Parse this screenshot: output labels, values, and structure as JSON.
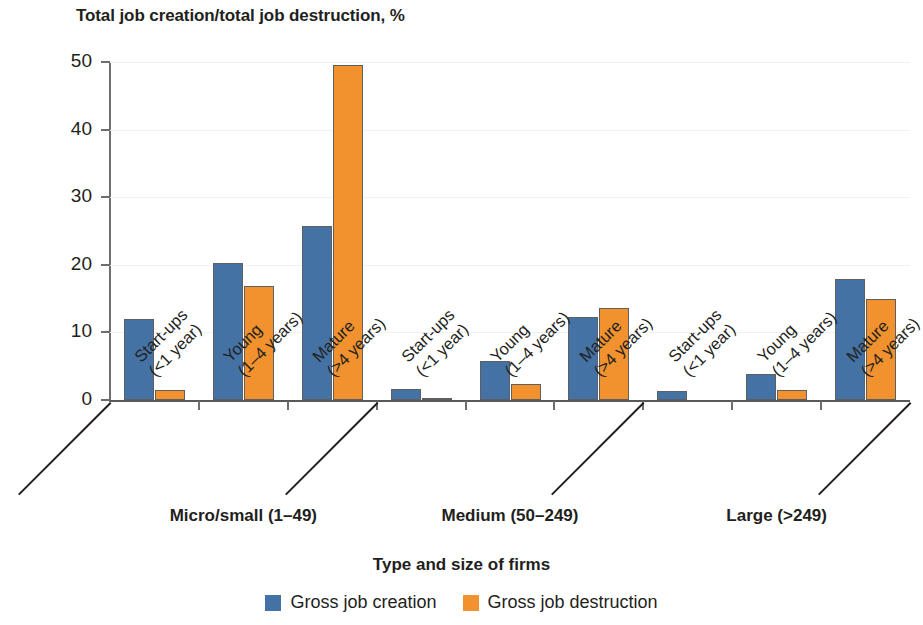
{
  "chart_data": {
    "type": "bar",
    "title": "Total job creation/total job destruction, %",
    "xlabel": "Type and size of firms",
    "ylabel": "",
    "ylim": [
      0,
      50
    ],
    "yticks": [
      0,
      10,
      20,
      30,
      40,
      50
    ],
    "grid": true,
    "legend_position": "bottom",
    "categories": [
      "Start-ups (<1 year)",
      "Young (1–4 years)",
      "Mature (>4 years)",
      "Start-ups (<1 year)",
      "Young (1–4 years)",
      "Mature (>4 years)",
      "Start-ups (<1 year)",
      "Young (1–4 years)",
      "Mature (>4 years)"
    ],
    "category_lines": [
      [
        "Start-ups",
        "(<1 year)"
      ],
      [
        "Young",
        "(1–4 years)"
      ],
      [
        "Mature",
        "(>4 years)"
      ],
      [
        "Start-ups",
        "(<1 year)"
      ],
      [
        "Young",
        "(1–4 years)"
      ],
      [
        "Mature",
        "(>4 years)"
      ],
      [
        "Start-ups",
        "(<1 year)"
      ],
      [
        "Young",
        "(1–4 years)"
      ],
      [
        "Mature",
        "(>4 years)"
      ]
    ],
    "groups": [
      {
        "label": "Micro/small (1–49)",
        "categories": [
          0,
          1,
          2
        ]
      },
      {
        "label": "Medium (50–249)",
        "categories": [
          3,
          4,
          5
        ]
      },
      {
        "label": "Large (>249)",
        "categories": [
          6,
          7,
          8
        ]
      }
    ],
    "series": [
      {
        "name": "Gross job creation",
        "color": "#4472a4",
        "values": [
          12.0,
          20.3,
          25.8,
          1.6,
          5.7,
          12.3,
          1.3,
          3.9,
          17.9
        ]
      },
      {
        "name": "Gross job destruction",
        "color": "#f2922f",
        "values": [
          1.5,
          16.8,
          49.6,
          0.3,
          2.4,
          13.6,
          0.0,
          1.5,
          14.9
        ]
      }
    ]
  },
  "legend": [
    {
      "label": "Gross job creation",
      "swatch": "creation"
    },
    {
      "label": "Gross job destruction",
      "swatch": "destruction"
    }
  ]
}
